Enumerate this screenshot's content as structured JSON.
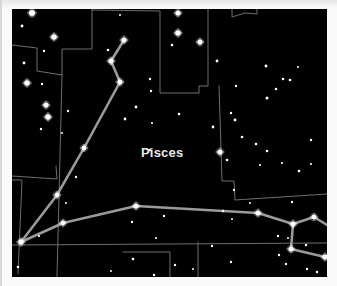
{
  "chart": {
    "constellation_name": "Pisces",
    "label_position": {
      "x": 129,
      "y": 136
    },
    "colors": {
      "background": "#000000",
      "figure_line": "#9a9a9a",
      "boundary_line": "#6e6e6e",
      "star": "#ffffff",
      "label": "#e8e8e8"
    }
  },
  "figure_lines": [
    {
      "points": [
        [
          112,
          31
        ],
        [
          99,
          52
        ],
        [
          108,
          73
        ],
        [
          72,
          139
        ],
        [
          45,
          186
        ],
        [
          9,
          233
        ]
      ]
    },
    {
      "points": [
        [
          9,
          233
        ],
        [
          51,
          214
        ],
        [
          124,
          197
        ],
        [
          246,
          204
        ],
        [
          281,
          215
        ],
        [
          302,
          208
        ],
        [
          315,
          216
        ]
      ]
    },
    {
      "points": [
        [
          281,
          215
        ],
        [
          279,
          240
        ],
        [
          313,
          248
        ]
      ]
    }
  ],
  "boundary_lines": [
    {
      "points": [
        [
          0,
          36
        ],
        [
          25,
          39
        ],
        [
          25,
          62
        ],
        [
          50,
          66
        ],
        [
          50,
          40
        ],
        [
          80,
          40
        ],
        [
          80,
          0
        ]
      ]
    },
    {
      "points": [
        [
          80,
          0
        ],
        [
          80,
          1
        ],
        [
          148,
          2
        ],
        [
          148,
          84
        ],
        [
          187,
          84
        ],
        [
          187,
          77
        ],
        [
          196,
          77
        ],
        [
          196,
          0
        ]
      ]
    },
    {
      "points": [
        [
          50,
          66
        ],
        [
          45,
          268
        ]
      ]
    },
    {
      "points": [
        [
          6,
          265
        ],
        [
          10,
          171
        ],
        [
          0,
          171
        ]
      ]
    },
    {
      "points": [
        [
          0,
          167
        ],
        [
          45,
          170
        ],
        [
          44,
          157
        ]
      ]
    },
    {
      "points": [
        [
          220,
          0
        ],
        [
          220,
          8
        ],
        [
          233,
          4
        ],
        [
          245,
          5
        ],
        [
          245,
          0
        ]
      ]
    },
    {
      "points": [
        [
          207,
          77
        ],
        [
          210,
          172
        ],
        [
          222,
          172
        ],
        [
          223,
          191
        ],
        [
          315,
          185
        ]
      ]
    },
    {
      "points": [
        [
          0,
          236
        ],
        [
          315,
          234
        ]
      ]
    },
    {
      "points": [
        [
          186,
          233
        ],
        [
          186,
          268
        ]
      ]
    },
    {
      "points": [
        [
          111,
          243
        ],
        [
          158,
          243
        ],
        [
          158,
          268
        ]
      ]
    }
  ],
  "stars": [
    {
      "x": 20,
      "y": 4,
      "r": 3.0
    },
    {
      "x": 10,
      "y": 17,
      "r": 1.4
    },
    {
      "x": 42,
      "y": 28,
      "r": 2.8
    },
    {
      "x": 32,
      "y": 42,
      "r": 1.2
    },
    {
      "x": 12,
      "y": 54,
      "r": 1.4
    },
    {
      "x": 15,
      "y": 74,
      "r": 2.8
    },
    {
      "x": 30,
      "y": 75,
      "r": 1.2
    },
    {
      "x": 34,
      "y": 96,
      "r": 2.6
    },
    {
      "x": 36,
      "y": 108,
      "r": 2.8
    },
    {
      "x": 29,
      "y": 120,
      "r": 1.2
    },
    {
      "x": 56,
      "y": 102,
      "r": 1.2
    },
    {
      "x": 50,
      "y": 124,
      "r": 1.0
    },
    {
      "x": 108,
      "y": 6,
      "r": 1.0
    },
    {
      "x": 96,
      "y": 41,
      "r": 1.3
    },
    {
      "x": 124,
      "y": 98,
      "r": 1.4
    },
    {
      "x": 113,
      "y": 110,
      "r": 1.4
    },
    {
      "x": 140,
      "y": 114,
      "r": 1.1
    },
    {
      "x": 166,
      "y": 4,
      "r": 2.6
    },
    {
      "x": 166,
      "y": 24,
      "r": 2.8
    },
    {
      "x": 160,
      "y": 36,
      "r": 1.3
    },
    {
      "x": 138,
      "y": 70,
      "r": 1.2
    },
    {
      "x": 139,
      "y": 82,
      "r": 1.2
    },
    {
      "x": 188,
      "y": 33,
      "r": 2.6
    },
    {
      "x": 205,
      "y": 52,
      "r": 1.4
    },
    {
      "x": 167,
      "y": 105,
      "r": 1.3
    },
    {
      "x": 201,
      "y": 118,
      "r": 1.4
    },
    {
      "x": 223,
      "y": 111,
      "r": 1.4
    },
    {
      "x": 224,
      "y": 77,
      "r": 1.2
    },
    {
      "x": 208,
      "y": 143,
      "r": 2.6
    },
    {
      "x": 215,
      "y": 151,
      "r": 1.3
    },
    {
      "x": 254,
      "y": 57,
      "r": 1.4
    },
    {
      "x": 271,
      "y": 70,
      "r": 1.3
    },
    {
      "x": 278,
      "y": 71,
      "r": 1.3
    },
    {
      "x": 264,
      "y": 80,
      "r": 1.3
    },
    {
      "x": 255,
      "y": 89,
      "r": 1.5
    },
    {
      "x": 286,
      "y": 58,
      "r": 1.0
    },
    {
      "x": 219,
      "y": 104,
      "r": 1.2
    },
    {
      "x": 230,
      "y": 128,
      "r": 1.3
    },
    {
      "x": 255,
      "y": 142,
      "r": 1.3
    },
    {
      "x": 244,
      "y": 135,
      "r": 1.3
    },
    {
      "x": 299,
      "y": 131,
      "r": 1.2
    },
    {
      "x": 248,
      "y": 156,
      "r": 1.1
    },
    {
      "x": 270,
      "y": 154,
      "r": 1.1
    },
    {
      "x": 299,
      "y": 155,
      "r": 1.1
    },
    {
      "x": 138,
      "y": 141,
      "r": 1.3
    },
    {
      "x": 64,
      "y": 168,
      "r": 1.2
    },
    {
      "x": 54,
      "y": 194,
      "r": 1.0
    },
    {
      "x": 27,
      "y": 227,
      "r": 1.1
    },
    {
      "x": 120,
      "y": 213,
      "r": 1.2
    },
    {
      "x": 152,
      "y": 207,
      "r": 1.2
    },
    {
      "x": 144,
      "y": 229,
      "r": 1.1
    },
    {
      "x": 121,
      "y": 250,
      "r": 1.3
    },
    {
      "x": 99,
      "y": 262,
      "r": 1.0
    },
    {
      "x": 142,
      "y": 266,
      "r": 1.2
    },
    {
      "x": 6,
      "y": 258,
      "r": 1.3
    },
    {
      "x": 163,
      "y": 256,
      "r": 1.2
    },
    {
      "x": 211,
      "y": 202,
      "r": 1.2
    },
    {
      "x": 200,
      "y": 237,
      "r": 1.2
    },
    {
      "x": 222,
      "y": 181,
      "r": 1.2
    },
    {
      "x": 220,
      "y": 210,
      "r": 1.0
    },
    {
      "x": 238,
      "y": 194,
      "r": 1.0
    },
    {
      "x": 266,
      "y": 227,
      "r": 1.2
    },
    {
      "x": 280,
      "y": 193,
      "r": 1.2
    },
    {
      "x": 287,
      "y": 162,
      "r": 1.3
    },
    {
      "x": 276,
      "y": 229,
      "r": 1.0
    },
    {
      "x": 267,
      "y": 246,
      "r": 1.2
    },
    {
      "x": 274,
      "y": 255,
      "r": 1.2
    },
    {
      "x": 294,
      "y": 236,
      "r": 1.2
    },
    {
      "x": 295,
      "y": 260,
      "r": 1.2
    },
    {
      "x": 305,
      "y": 263,
      "r": 1.2
    },
    {
      "x": 219,
      "y": 253,
      "r": 1.2
    },
    {
      "x": 181,
      "y": 260,
      "r": 1.0
    }
  ],
  "figure_stars": [
    {
      "x": 112,
      "y": 31,
      "r": 2.6
    },
    {
      "x": 99,
      "y": 52,
      "r": 2.6
    },
    {
      "x": 108,
      "y": 73,
      "r": 2.6
    },
    {
      "x": 72,
      "y": 139,
      "r": 2.4
    },
    {
      "x": 45,
      "y": 186,
      "r": 2.4
    },
    {
      "x": 9,
      "y": 233,
      "r": 2.8
    },
    {
      "x": 51,
      "y": 214,
      "r": 2.4
    },
    {
      "x": 124,
      "y": 197,
      "r": 2.6
    },
    {
      "x": 246,
      "y": 204,
      "r": 2.6
    },
    {
      "x": 281,
      "y": 215,
      "r": 2.6
    },
    {
      "x": 302,
      "y": 208,
      "r": 2.4
    },
    {
      "x": 279,
      "y": 240,
      "r": 2.6
    },
    {
      "x": 313,
      "y": 248,
      "r": 2.6
    }
  ]
}
